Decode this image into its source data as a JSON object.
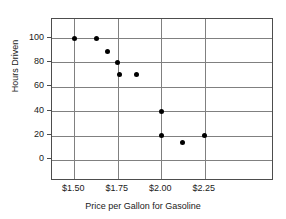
{
  "chart_data": {
    "type": "scatter",
    "title": "",
    "xlabel": "Price per Gallon for Gasoline",
    "ylabel": "Hours Driven",
    "xlim": [
      1.375,
      1.625
    ],
    "x_axis": {
      "min": 1.3727,
      "max": 2.6364,
      "ticks": [
        1.5,
        1.75,
        2.0,
        2.25
      ],
      "tick_labels": [
        "$1.50",
        "$1.75",
        "$2.00",
        "$2.25"
      ]
    },
    "y_axis": {
      "min": -15.6,
      "max": 115.6,
      "ticks": [
        0,
        20,
        40,
        60,
        80,
        100
      ],
      "tick_labels": [
        "0",
        "20",
        "40",
        "60",
        "80",
        "100"
      ]
    },
    "grid": true,
    "legend": false,
    "points": [
      {
        "x": 1.5,
        "y": 100
      },
      {
        "x": 1.63,
        "y": 100
      },
      {
        "x": 1.69,
        "y": 89
      },
      {
        "x": 1.75,
        "y": 80
      },
      {
        "x": 1.76,
        "y": 70
      },
      {
        "x": 1.86,
        "y": 70
      },
      {
        "x": 2.0,
        "y": 40
      },
      {
        "x": 2.0,
        "y": 20
      },
      {
        "x": 2.12,
        "y": 14
      },
      {
        "x": 2.25,
        "y": 20
      }
    ],
    "colors": {
      "point": "#000000",
      "grid": "#808080",
      "frame": "#4d4d4d",
      "background": "#ffffff",
      "text": "#1a1a1a"
    }
  }
}
